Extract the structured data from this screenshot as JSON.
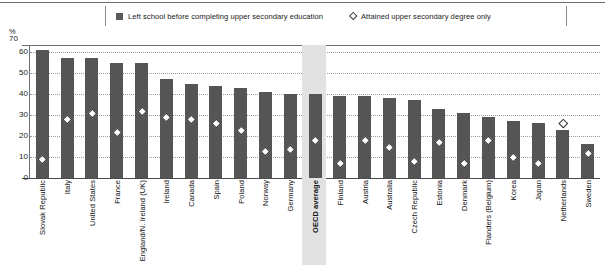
{
  "legend": {
    "items": [
      {
        "marker": "bar-swatch",
        "label": "Left school before completing upper secondary education"
      },
      {
        "marker": "diamond-marker",
        "label": "Attained upper secondary degree only"
      }
    ]
  },
  "axis": {
    "unit_label": "%",
    "ticks": [
      "70",
      "60",
      "50",
      "40",
      "30",
      "20",
      "10",
      "0"
    ]
  },
  "chart_data": {
    "type": "bar",
    "title": "",
    "xlabel": "",
    "ylabel": "%",
    "ylim": [
      0,
      70
    ],
    "grid": true,
    "legend_position": "top",
    "highlighted_category": "OECD average",
    "categories": [
      "Slovak Republic",
      "Italy",
      "United States",
      "France",
      "England/N. Ireland (UK)",
      "Ireland",
      "Canada",
      "Spain",
      "Poland",
      "Norway",
      "Germany",
      "OECD average",
      "Finland",
      "Austria",
      "Australia",
      "Czech Republic",
      "Estonia",
      "Denmark",
      "Flanders (Belgium)",
      "Korea",
      "Japan",
      "Netherlands",
      "Sweden"
    ],
    "series": [
      {
        "name": "Left school before completing upper secondary education",
        "type": "bar",
        "values": [
          61,
          57,
          57,
          55,
          55,
          47,
          45,
          44,
          43,
          41,
          40,
          40,
          39,
          39,
          38,
          37,
          33,
          31,
          29,
          27,
          26,
          23,
          16
        ]
      },
      {
        "name": "Attained upper secondary degree only",
        "type": "scatter",
        "marker": "diamond",
        "values": [
          9,
          28,
          31,
          22,
          32,
          29,
          28,
          26,
          23,
          13,
          14,
          18,
          7,
          18,
          15,
          8,
          17,
          7,
          18,
          10,
          7,
          26,
          12
        ]
      }
    ]
  }
}
